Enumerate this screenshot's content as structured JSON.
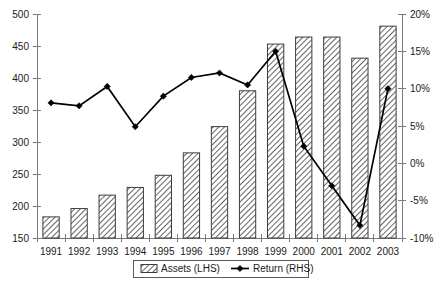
{
  "chart_data": {
    "type": "bar",
    "title": "",
    "subtitle": "",
    "xlabel": "",
    "ylabel": "",
    "grid": false,
    "legend_position": "bottom",
    "categories": [
      "1991",
      "1992",
      "1993",
      "1994",
      "1995",
      "1996",
      "1997",
      "1998",
      "1999",
      "2000",
      "2001",
      "2002",
      "2003"
    ],
    "series": [
      {
        "name": "Assets (LHS)",
        "type": "bar",
        "axis": "left",
        "values": [
          183,
          196,
          217,
          229,
          248,
          283,
          324,
          380,
          453,
          464,
          464,
          431,
          481
        ]
      },
      {
        "name": "Return (RHS)",
        "type": "line",
        "axis": "right",
        "marker": "diamond",
        "values": [
          8.1,
          7.7,
          10.3,
          4.9,
          9.0,
          11.5,
          12.1,
          10.5,
          15.0,
          2.3,
          -3.0,
          -8.3,
          10.0
        ]
      }
    ],
    "left_axis": {
      "ylim": [
        150,
        500
      ],
      "ticks": [
        150,
        200,
        250,
        300,
        350,
        400,
        450,
        500
      ],
      "tick_labels": [
        "150",
        "200",
        "250",
        "300",
        "350",
        "400",
        "450",
        "500"
      ]
    },
    "right_axis": {
      "ylim": [
        -10,
        20
      ],
      "ticks": [
        -10,
        -5,
        0,
        5,
        10,
        15,
        20
      ],
      "tick_labels": [
        "-10%",
        "-5%",
        "0%",
        "5%",
        "10%",
        "15%",
        "20%"
      ]
    },
    "legend": [
      {
        "label": "Assets (LHS)",
        "marker": "hatched-bar"
      },
      {
        "label": "Return (RHS)",
        "marker": "line-diamond"
      }
    ],
    "colors": {
      "bar_fill": "#ffffff",
      "bar_hatch": "#4a4a4a",
      "bar_stroke": "#3d3d3d",
      "line": "#000000",
      "axis": "#7b7b7b",
      "text": "#1a1a1a",
      "background": "#ffffff"
    }
  }
}
